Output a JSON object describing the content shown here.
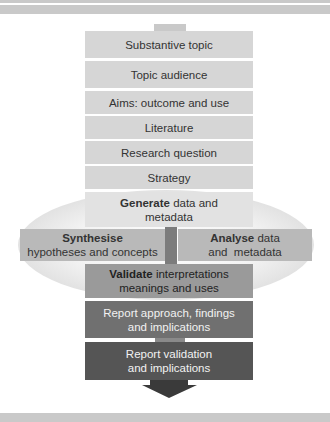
{
  "diagram": {
    "colors": {
      "band": "#c9c9c9",
      "stack_box": "#d6d6d6",
      "generate_box": "#e2e2e2",
      "side_box": "#b9b9b9",
      "center_connector": "#7c7c7c",
      "validate_box": "#9a9a9a",
      "report_approach_box": "#707070",
      "report_validation_box": "#555555",
      "arrow": "#3a3a3a"
    },
    "steps": [
      {
        "label": "Substantive topic"
      },
      {
        "label": "Topic audience"
      },
      {
        "label": "Aims: outcome and use"
      },
      {
        "label": "Literature"
      },
      {
        "label": "Research question"
      },
      {
        "label": "Strategy"
      }
    ],
    "generate": {
      "bold": "Generate",
      "rest_line1": " data and",
      "line2": "metadata"
    },
    "synthesise": {
      "bold": "Synthesise",
      "line2": "hypotheses and concepts"
    },
    "analyse": {
      "bold": "Analyse",
      "rest_line1": " data",
      "line2": "and  metadata"
    },
    "validate": {
      "bold": "Validate",
      "rest_line1": " interpretations",
      "line2": "meanings and uses"
    },
    "report_approach": {
      "line1": "Report approach, findings",
      "line2": "and implications"
    },
    "report_validation": {
      "line1": "Report validation",
      "line2": "and implications"
    }
  }
}
